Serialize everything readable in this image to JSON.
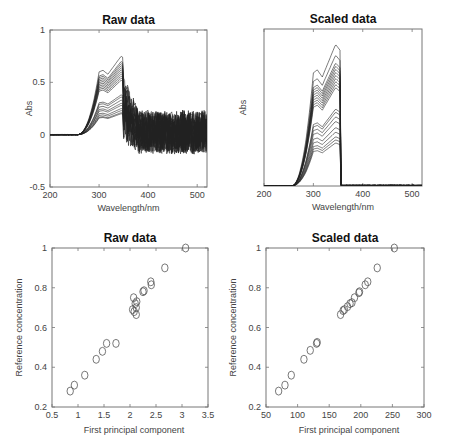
{
  "chart_data": [
    {
      "id": "raw-spectra",
      "type": "line",
      "title": "Raw data",
      "xlabel": "Wavelength/nm",
      "ylabel": "Abs",
      "xlim": [
        200,
        520
      ],
      "ylim": [
        -0.5,
        1
      ],
      "xticks": [
        200,
        300,
        400,
        500
      ],
      "yticks": [
        -0.5,
        0,
        0.5,
        1
      ],
      "ytick_labels": [
        "-0.5",
        "0",
        "0.5",
        "1"
      ],
      "grid": false,
      "description": "About 20 UV absorbance spectra rising from 0 near 260 nm to plateaus 0.2-0.75 at 300-350 nm, then noisy between -0.35 and 0.8 beyond 350 nm",
      "peak_levels": [
        0.75,
        0.7,
        0.68,
        0.66,
        0.64,
        0.62,
        0.6,
        0.58,
        0.56,
        0.54,
        0.52,
        0.38,
        0.36,
        0.33,
        0.3,
        0.28,
        0.25,
        0.23,
        0.21,
        0.2
      ]
    },
    {
      "id": "scaled-spectra",
      "type": "line",
      "title": "Scaled data",
      "xlabel": "Wavelength/nm",
      "ylabel": "Abs",
      "xlim": [
        200,
        520
      ],
      "xticks": [
        200,
        300,
        400,
        500
      ],
      "yticks": [],
      "grid": false,
      "description": "Same spectra scaled; region beyond ~355 nm set to near zero",
      "peak_levels": [
        0.92,
        0.85,
        0.8,
        0.78,
        0.76,
        0.74,
        0.72,
        0.7,
        0.68,
        0.66,
        0.64,
        0.5,
        0.48,
        0.45,
        0.42,
        0.38,
        0.35,
        0.32,
        0.3,
        0.28
      ]
    },
    {
      "id": "raw-scatter",
      "type": "scatter",
      "title": "Raw data",
      "xlabel": "First principal component",
      "ylabel": "Reference concentration",
      "xlim": [
        0.5,
        3.5
      ],
      "ylim": [
        0.2,
        1
      ],
      "xticks": [
        0.5,
        1,
        1.5,
        2,
        2.5,
        3,
        3.5
      ],
      "xtick_labels": [
        "0.5",
        "1",
        "1.5",
        "2",
        "2.5",
        "3",
        "3.5"
      ],
      "yticks": [
        0.2,
        0.4,
        0.6,
        0.8,
        1
      ],
      "ytick_labels": [
        "0.2",
        "0.4",
        "0.6",
        "0.8",
        "1"
      ],
      "grid": false,
      "marker": "circle-open",
      "points": [
        [
          0.85,
          0.28
        ],
        [
          0.93,
          0.31
        ],
        [
          1.13,
          0.36
        ],
        [
          1.35,
          0.44
        ],
        [
          1.47,
          0.48
        ],
        [
          1.55,
          0.52
        ],
        [
          1.73,
          0.52
        ],
        [
          2.05,
          0.69
        ],
        [
          2.07,
          0.75
        ],
        [
          2.08,
          0.68
        ],
        [
          2.1,
          0.72
        ],
        [
          2.12,
          0.7
        ],
        [
          2.13,
          0.73
        ],
        [
          2.12,
          0.665
        ],
        [
          2.25,
          0.78
        ],
        [
          2.27,
          0.785
        ],
        [
          2.4,
          0.83
        ],
        [
          2.41,
          0.815
        ],
        [
          2.67,
          0.9
        ],
        [
          3.07,
          1.0
        ]
      ]
    },
    {
      "id": "scaled-scatter",
      "type": "scatter",
      "title": "Scaled data",
      "xlabel": "First principal component",
      "ylabel": "Reference concentration",
      "xlim": [
        50,
        300
      ],
      "ylim": [
        0.2,
        1
      ],
      "xticks": [
        50,
        100,
        150,
        200,
        250,
        300
      ],
      "xtick_labels": [
        "50",
        "100",
        "150",
        "200",
        "250",
        "300"
      ],
      "yticks": [
        0.2,
        0.4,
        0.6,
        0.8,
        1
      ],
      "ytick_labels": [
        "0.2",
        "0.4",
        "0.6",
        "0.8",
        "1"
      ],
      "grid": false,
      "marker": "circle-open",
      "points": [
        [
          70,
          0.28
        ],
        [
          80,
          0.31
        ],
        [
          90,
          0.36
        ],
        [
          110,
          0.44
        ],
        [
          120,
          0.485
        ],
        [
          130,
          0.52
        ],
        [
          131,
          0.525
        ],
        [
          168,
          0.665
        ],
        [
          172,
          0.685
        ],
        [
          174,
          0.69
        ],
        [
          179,
          0.705
        ],
        [
          183,
          0.72
        ],
        [
          186,
          0.725
        ],
        [
          190,
          0.75
        ],
        [
          197,
          0.775
        ],
        [
          198,
          0.78
        ],
        [
          207,
          0.815
        ],
        [
          211,
          0.83
        ],
        [
          226,
          0.9
        ],
        [
          253,
          1.0
        ]
      ]
    }
  ]
}
